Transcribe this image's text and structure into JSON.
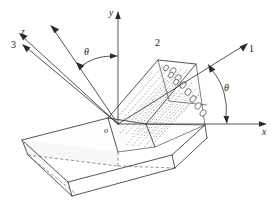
{
  "figure": {
    "colors": {
      "stroke": "#2b2b2b",
      "hidden_stroke": "#555555",
      "fiber_stroke": "#6b6b6b",
      "background": "#ffffff"
    }
  },
  "labels": {
    "axis_1": "1",
    "axis_2": "2",
    "axis_3": "3",
    "axis_x": "x",
    "axis_y": "y",
    "axis_z": "z",
    "origin": "o",
    "theta_left": "θ",
    "theta_right": "θ"
  },
  "axes": {
    "global": [
      {
        "name": "x",
        "label": "x",
        "direction": "right-horizontal"
      },
      {
        "name": "y",
        "label": "y",
        "direction": "up-vertical"
      },
      {
        "name": "z",
        "label": "z",
        "direction": "upper-left-oblique"
      }
    ],
    "material": [
      {
        "name": "1",
        "label": "1",
        "direction": "upper-right",
        "note": "fiber direction"
      },
      {
        "name": "2",
        "label": "2",
        "direction": "upper-left"
      },
      {
        "name": "3",
        "label": "3",
        "direction": "upper-left-oblique"
      }
    ]
  },
  "angles": [
    {
      "name": "theta-between-y-and-2",
      "label": "θ",
      "from": "2",
      "to": "y"
    },
    {
      "name": "theta-between-x-and-1",
      "label": "θ",
      "from": "x",
      "to": "1"
    }
  ]
}
